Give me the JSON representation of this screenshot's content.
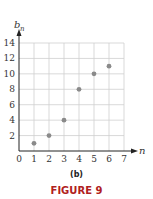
{
  "chart_data": {
    "type": "scatter",
    "title": "",
    "xlabel": "n",
    "ylabel": "b",
    "ylabel_subscript": "n",
    "x": [
      1,
      2,
      3,
      4,
      5,
      6
    ],
    "y": [
      1,
      2,
      4,
      8,
      10,
      11
    ],
    "xlim": [
      0,
      7
    ],
    "ylim": [
      0,
      14
    ],
    "xticks": [
      "0",
      "1",
      "2",
      "3",
      "4",
      "5",
      "6",
      "7"
    ],
    "yticks": [
      "2",
      "4",
      "6",
      "8",
      "10",
      "12",
      "14"
    ],
    "grid": true,
    "point_color": "#8a8a8a"
  },
  "captions": {
    "panel": "(b)",
    "figure": "FIGURE 9"
  }
}
